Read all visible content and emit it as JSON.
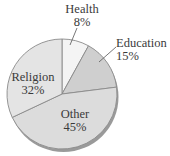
{
  "chart_data": {
    "type": "pie",
    "title": "",
    "categories": [
      "Health",
      "Education",
      "Other",
      "Religion"
    ],
    "values": [
      8,
      15,
      45,
      32
    ],
    "labels": [
      "8%",
      "15%",
      "45%",
      "32%"
    ],
    "colors": [
      "#f4f4f4",
      "#cfcfcf",
      "#dcdcdc",
      "#e4e4e4"
    ],
    "legend": "none",
    "start_angle": "12 o'clock, clockwise"
  },
  "labels": {
    "health": {
      "name": "Health",
      "pct": "8%"
    },
    "education": {
      "name": "Education",
      "pct": "15%"
    },
    "other": {
      "name": "Other",
      "pct": "45%"
    },
    "religion": {
      "name": "Religion",
      "pct": "32%"
    }
  }
}
